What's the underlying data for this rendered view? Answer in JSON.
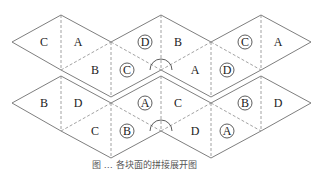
{
  "diagram": {
    "type": "tetrahedron-style triangular nets (two folding layouts)",
    "nets": [
      {
        "name": "top-net",
        "labels": [
          {
            "text": "C",
            "circled": false,
            "x": 44,
            "y": 42
          },
          {
            "text": "A",
            "circled": false,
            "x": 78,
            "y": 42
          },
          {
            "text": "B",
            "circled": false,
            "x": 95,
            "y": 70
          },
          {
            "text": "C",
            "circled": true,
            "x": 127,
            "y": 70
          },
          {
            "text": "D",
            "circled": true,
            "x": 145,
            "y": 42
          },
          {
            "text": "B",
            "circled": false,
            "x": 178,
            "y": 42
          },
          {
            "text": "A",
            "circled": false,
            "x": 195,
            "y": 70
          },
          {
            "text": "D",
            "circled": true,
            "x": 227,
            "y": 70
          },
          {
            "text": "C",
            "circled": true,
            "x": 245,
            "y": 42
          },
          {
            "text": "A",
            "circled": false,
            "x": 278,
            "y": 42
          }
        ]
      },
      {
        "name": "bottom-net",
        "labels": [
          {
            "text": "B",
            "circled": false,
            "x": 44,
            "y": 103
          },
          {
            "text": "D",
            "circled": false,
            "x": 78,
            "y": 103
          },
          {
            "text": "C",
            "circled": false,
            "x": 95,
            "y": 131
          },
          {
            "text": "B",
            "circled": true,
            "x": 127,
            "y": 131
          },
          {
            "text": "A",
            "circled": true,
            "x": 145,
            "y": 103
          },
          {
            "text": "C",
            "circled": false,
            "x": 178,
            "y": 103
          },
          {
            "text": "D",
            "circled": false,
            "x": 195,
            "y": 131
          },
          {
            "text": "A",
            "circled": true,
            "x": 227,
            "y": 131
          },
          {
            "text": "B",
            "circled": true,
            "x": 245,
            "y": 103
          },
          {
            "text": "D",
            "circled": false,
            "x": 278,
            "y": 103
          }
        ]
      }
    ],
    "caption": "图 … 各块面的拼接展开图"
  }
}
